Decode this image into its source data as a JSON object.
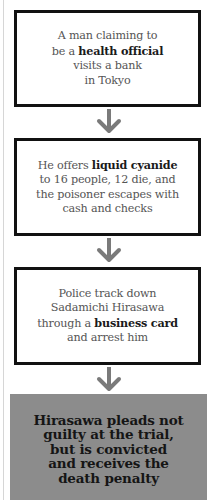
{
  "flowchart": {
    "steps": [
      {
        "pre": "A man claiming to be a ",
        "bold": "health official",
        "post": " visits a bank in Tokyo"
      },
      {
        "pre": "He offers ",
        "bold": "liquid cyanide",
        "post": " to 16 people, 12 die, and the poisoner escapes with cash and checks"
      },
      {
        "pre": "Police track down Sadamichi Hirasawa through a ",
        "bold": "business card",
        "post": " and arrest him"
      }
    ],
    "outcome": "Hirasawa pleads not guilty at the trial, but is convicted and receives the death penalty",
    "arrow_icon": "down-arrow-icon",
    "colors": {
      "box_border": "#111111",
      "arrow": "#7a7a7a",
      "outcome_fill": "#8c8c8c"
    }
  }
}
